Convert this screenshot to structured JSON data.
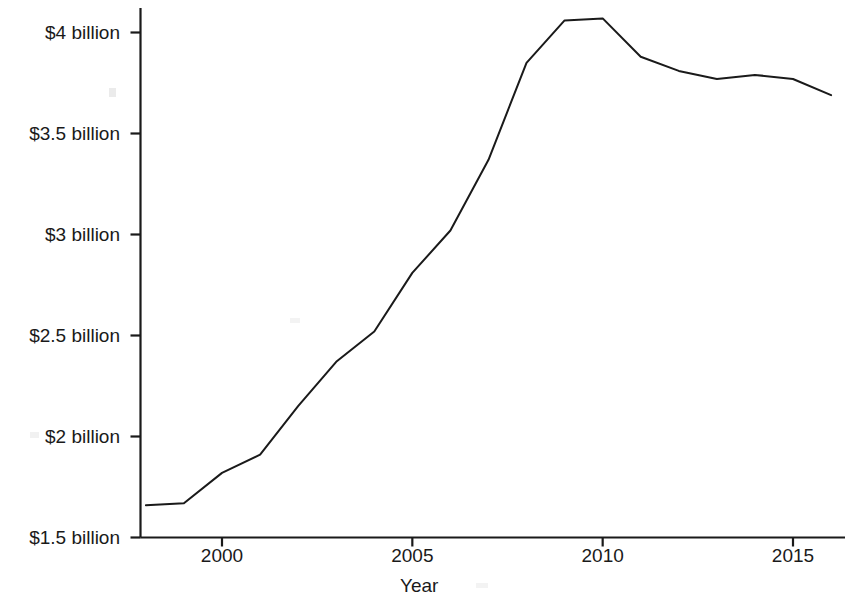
{
  "chart_data": {
    "type": "line",
    "title": "",
    "xlabel": "Year",
    "ylabel": "Lobbying Spending by Mainstream Groups",
    "x": [
      1998,
      1999,
      2000,
      2001,
      2002,
      2003,
      2004,
      2005,
      2006,
      2007,
      2008,
      2009,
      2010,
      2011,
      2012,
      2013,
      2014,
      2015,
      2016
    ],
    "values": [
      1.66,
      1.67,
      1.82,
      1.91,
      2.15,
      2.37,
      2.52,
      2.81,
      3.02,
      3.37,
      3.85,
      4.06,
      4.07,
      3.88,
      3.81,
      3.77,
      3.79,
      3.77,
      3.69
    ],
    "series": [
      {
        "name": "Lobbying Spending by Mainstream Groups",
        "values": [
          1.66,
          1.67,
          1.82,
          1.91,
          2.15,
          2.37,
          2.52,
          2.81,
          3.02,
          3.37,
          3.85,
          4.06,
          4.07,
          3.88,
          3.81,
          3.77,
          3.79,
          3.77,
          3.69
        ]
      }
    ],
    "units": "billions of US dollars",
    "xlim": [
      1998,
      1916
    ],
    "ylim": [
      1.5,
      4.15
    ],
    "grid": false,
    "legend": "none",
    "line_color": "#1a1a1a",
    "line_width": 2,
    "x_ticks": [
      2000,
      2005,
      2010,
      2015
    ],
    "x_tick_labels": [
      "2000",
      "2005",
      "2010",
      "2015"
    ],
    "y_ticks": [
      1.5,
      2.0,
      2.5,
      3.0,
      3.5,
      4.0
    ],
    "y_tick_labels": [
      "$1.5 billion",
      "$2 billion",
      "$2.5 billion",
      "$3 billion",
      "$3.5 billion",
      "$4 billion"
    ]
  },
  "axes": {
    "y_axis_label": "Lobbying Spending by Mainstream Groups",
    "x_axis_label": "Year"
  },
  "colors": {
    "line": "#1a1a1a",
    "axis": "#1a1a1a",
    "background": "#ffffff"
  }
}
